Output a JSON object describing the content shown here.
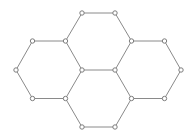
{
  "figure": {
    "width": 195,
    "height": 139,
    "background_color": "#ffffff",
    "edge_color": "#8a8a8a",
    "edge_width": 1,
    "vertex_stroke_color": "#7d7d7d",
    "vertex_fill_color": "#ffffff",
    "vertex_radius": 2.2,
    "hexagon_count": 4,
    "vertex_count": 16,
    "edge_count": 19,
    "vertices": [
      {
        "id": "v0",
        "x": 82,
        "y": 13
      },
      {
        "id": "v1",
        "x": 115,
        "y": 13
      },
      {
        "id": "v2",
        "x": 32.5,
        "y": 41
      },
      {
        "id": "v3",
        "x": 65.5,
        "y": 41
      },
      {
        "id": "v4",
        "x": 131.5,
        "y": 41
      },
      {
        "id": "v5",
        "x": 164.5,
        "y": 41
      },
      {
        "id": "v6",
        "x": 16,
        "y": 70
      },
      {
        "id": "v7",
        "x": 82,
        "y": 70
      },
      {
        "id": "v8",
        "x": 115,
        "y": 70
      },
      {
        "id": "v9",
        "x": 181,
        "y": 70
      },
      {
        "id": "v10",
        "x": 32.5,
        "y": 98.5
      },
      {
        "id": "v11",
        "x": 65.5,
        "y": 98.5
      },
      {
        "id": "v12",
        "x": 131.5,
        "y": 98.5
      },
      {
        "id": "v13",
        "x": 164.5,
        "y": 98.5
      },
      {
        "id": "v14",
        "x": 82,
        "y": 127
      },
      {
        "id": "v15",
        "x": 115,
        "y": 127
      }
    ],
    "edges": [
      [
        "v0",
        "v1"
      ],
      [
        "v3",
        "v0"
      ],
      [
        "v1",
        "v4"
      ],
      [
        "v4",
        "v8"
      ],
      [
        "v7",
        "v3"
      ],
      [
        "v7",
        "v8"
      ],
      [
        "v2",
        "v3"
      ],
      [
        "v6",
        "v2"
      ],
      [
        "v10",
        "v6"
      ],
      [
        "v11",
        "v10"
      ],
      [
        "v7",
        "v11"
      ],
      [
        "v4",
        "v5"
      ],
      [
        "v5",
        "v9"
      ],
      [
        "v9",
        "v13"
      ],
      [
        "v13",
        "v12"
      ],
      [
        "v12",
        "v8"
      ],
      [
        "v12",
        "v15"
      ],
      [
        "v15",
        "v14"
      ],
      [
        "v14",
        "v11"
      ]
    ]
  }
}
